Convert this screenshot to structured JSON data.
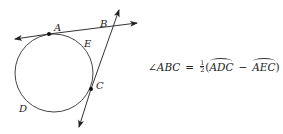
{
  "diagram": {
    "type": "circle-secant-tangent",
    "points": {
      "A": {
        "label": "A",
        "x": 49,
        "y": 34
      },
      "B": {
        "label": "B",
        "x": 113,
        "y": 27
      },
      "C": {
        "label": "C",
        "x": 91,
        "y": 89
      },
      "D": {
        "label": "D",
        "x": 25,
        "y": 110
      },
      "E": {
        "label": "E",
        "x": 87,
        "y": 46
      }
    },
    "circle": {
      "cx": 54,
      "cy": 73,
      "r": 39
    },
    "line_color": "#333333"
  },
  "formula": {
    "angle": "∠ABC",
    "equals": "=",
    "half_num": "1",
    "half_den": "2",
    "open_paren": "(",
    "arc1": "ADC",
    "minus": "−",
    "arc2": "AEC",
    "close_paren": ")"
  }
}
